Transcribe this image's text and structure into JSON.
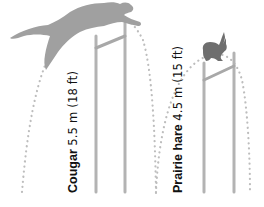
{
  "figure": {
    "type": "jump-height-comparison",
    "animals": [
      {
        "name": "Cougar",
        "measurement": "5.5 m (18 ft)",
        "height_m": 5.5,
        "height_ft": 18,
        "icon": "cougar-silhouette-icon"
      },
      {
        "name": "Prairie hare",
        "measurement": "4.5 m (15 ft)",
        "height_m": 4.5,
        "height_ft": 15,
        "icon": "hare-silhouette-icon"
      }
    ]
  },
  "colors": {
    "poles": "#b3b3b3",
    "arc_dots": "#bdbdbd",
    "cougar": "#9e9e9e",
    "hare": "#6e6e6e",
    "text": "#111111"
  }
}
